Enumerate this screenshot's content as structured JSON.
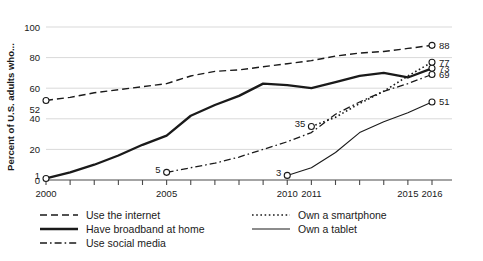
{
  "chart_data": {
    "type": "line",
    "title": "",
    "xlabel": "",
    "ylabel": "Percent of U.S. adults who...",
    "xlim": [
      2000,
      2016
    ],
    "ylim": [
      0,
      100
    ],
    "grid": true,
    "legend_position": "below-plot",
    "y_ticks": [
      "0",
      "20",
      "40",
      "60",
      "80",
      "100"
    ],
    "x_ticks": [
      "2000",
      "2005",
      "2010",
      "2011",
      "2015",
      "2016"
    ],
    "x_tick_years": [
      2000,
      2005,
      2010,
      2011,
      2015,
      2016
    ],
    "x_all_tick_years": [
      2000,
      2001,
      2002,
      2003,
      2004,
      2005,
      2006,
      2007,
      2008,
      2009,
      2010,
      2011,
      2012,
      2013,
      2014,
      2015,
      2016
    ],
    "series": [
      {
        "name": "Use the internet",
        "style": "dashed",
        "x": [
          2000,
          2001,
          2002,
          2003,
          2004,
          2005,
          2006,
          2007,
          2008,
          2009,
          2010,
          2011,
          2012,
          2013,
          2014,
          2015,
          2016
        ],
        "values": [
          52,
          54,
          57,
          59,
          61,
          63,
          68,
          71,
          72,
          74,
          76,
          78,
          81,
          83,
          84,
          86,
          88
        ],
        "start_label": "52",
        "end_label": "88"
      },
      {
        "name": "Have broadband at home",
        "style": "solid-thick",
        "x": [
          2000,
          2001,
          2002,
          2003,
          2004,
          2005,
          2006,
          2007,
          2008,
          2009,
          2010,
          2011,
          2012,
          2013,
          2014,
          2015,
          2016
        ],
        "values": [
          1,
          5,
          10,
          16,
          23,
          29,
          42,
          49,
          55,
          63,
          62,
          60,
          64,
          68,
          70,
          67,
          73
        ],
        "start_label": "1",
        "end_label": "73"
      },
      {
        "name": "Use social media",
        "style": "dash-dot",
        "x": [
          2005,
          2006,
          2007,
          2008,
          2009,
          2010,
          2011,
          2012,
          2013,
          2014,
          2015,
          2016
        ],
        "values": [
          5,
          8,
          11,
          15,
          20,
          25,
          31,
          43,
          51,
          58,
          63,
          69
        ],
        "start_label": "5",
        "end_label": "69"
      },
      {
        "name": "Own a smartphone",
        "style": "dotted",
        "x": [
          2011,
          2012,
          2013,
          2014,
          2015,
          2016
        ],
        "values": [
          35,
          41,
          50,
          58,
          68,
          77
        ],
        "start_label": "35",
        "end_label": "77"
      },
      {
        "name": "Own a tablet",
        "style": "solid-thin",
        "x": [
          2010,
          2011,
          2012,
          2013,
          2014,
          2015,
          2016
        ],
        "values": [
          3,
          8,
          18,
          31,
          38,
          44,
          51
        ],
        "start_label": "3",
        "end_label": "51"
      }
    ],
    "legend": [
      {
        "label": "Use the internet",
        "style": "dashed"
      },
      {
        "label": "Own a smartphone",
        "style": "dotted"
      },
      {
        "label": "Have broadband at home",
        "style": "solid-thick"
      },
      {
        "label": "Own a tablet",
        "style": "solid-thin"
      },
      {
        "label": "Use social media",
        "style": "dash-dot"
      }
    ]
  }
}
